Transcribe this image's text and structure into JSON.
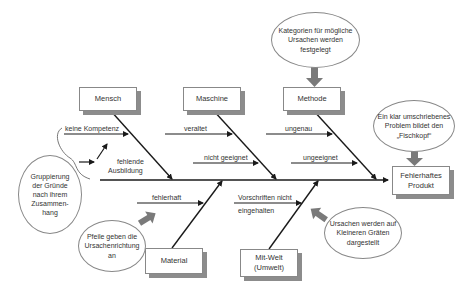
{
  "diagram": {
    "type": "fishbone (Ishikawa) diagram",
    "effect": "Fehlerhaftes Produkt",
    "categories": {
      "mensch": {
        "label": "Mensch",
        "causes": [
          "keine Kompetenz",
          "fehlende Ausbildung"
        ]
      },
      "maschine": {
        "label": "Maschine",
        "causes": [
          "veraltet",
          "nicht geeignet"
        ]
      },
      "methode": {
        "label": "Methode",
        "causes": [
          "ungenau",
          "ungeeignet"
        ]
      },
      "material": {
        "label": "Material",
        "causes": [
          "fehlerhaft"
        ]
      },
      "mitwelt": {
        "label": "Mit-Welt (Umwelt)",
        "causes": [
          "Vorschriften nicht eingehalten"
        ]
      }
    },
    "annotations": {
      "kategorien": "Kategorien für mögliche Ursachen werden festgelegt",
      "fischkopf": "Ein klar umschriebenes Problem bildet den „Fischkopf“",
      "gruppierung": "Gruppierung der Gründe nach ihrem Zusammen-hang",
      "pfeile": "Pfeile geben die Ursachenrichtung an",
      "graeten": "Ursachen werden auf Kleineren Gräten dargestellt"
    }
  },
  "labels": {
    "mensch": "Mensch",
    "maschine": "Maschine",
    "methode": "Methode",
    "material": "Material",
    "mitwelt_1": "Mit-Welt",
    "mitwelt_2": "(Umwelt)",
    "effect_1": "Fehlerhaftes",
    "effect_2": "Produkt",
    "keine_kompetenz": "keine Kompetenz",
    "fehlende_1": "fehlende",
    "fehlende_2": "Ausbildung",
    "veraltet": "veraltet",
    "nicht_geeignet": "nicht geeignet",
    "ungenau": "ungenau",
    "ungeeignet": "ungeeignet",
    "fehlerhaft": "fehlerhaft",
    "vorschriften_1": "Vorschriften nicht",
    "vorschriften_2": "eingehalten"
  },
  "notes": {
    "kategorien_1": "Kategorien für mögliche",
    "kategorien_2": "Ursachen werden",
    "kategorien_3": "festgelegt",
    "fischkopf_1": "Ein klar umschriebenes",
    "fischkopf_2": "Problem bildet den",
    "fischkopf_3": "„Fischkopf“",
    "gruppierung_1": "Gruppierung",
    "gruppierung_2": "der Gründe",
    "gruppierung_3": "nach ihrem",
    "gruppierung_4": "Zusammen-",
    "gruppierung_5": "hang",
    "pfeile_1": "Pfeile geben die",
    "pfeile_2": "Ursachenrichtung",
    "pfeile_3": "an",
    "graeten_1": "Ursachen werden auf",
    "graeten_2": "Kleineren Gräten",
    "graeten_3": "dargestellt"
  },
  "colors": {
    "line": "#1a1a1a",
    "box_border": "#888888",
    "shadow": "#8c8c8c",
    "block_arrow": "#7a7a7a"
  }
}
